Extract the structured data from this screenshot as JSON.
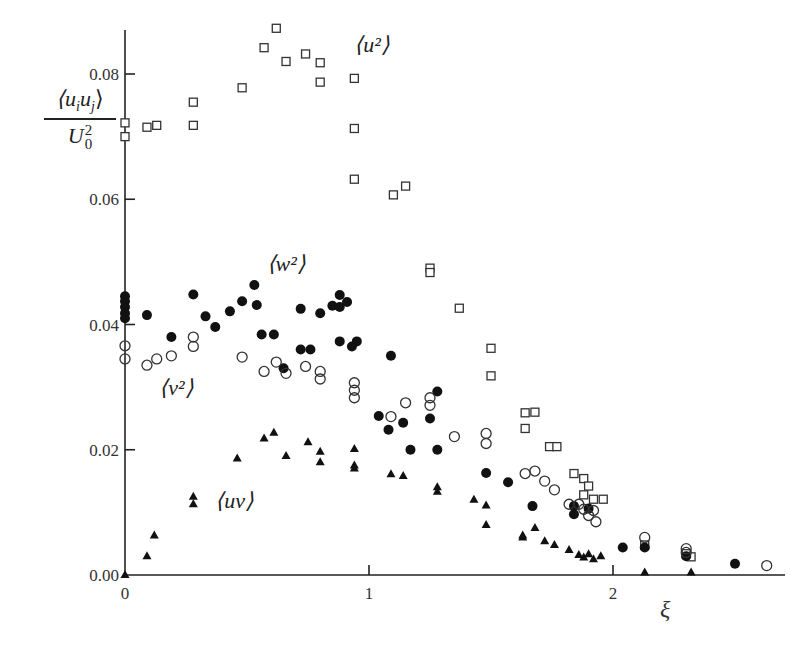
{
  "chart_data": {
    "type": "scatter",
    "title": "",
    "xlabel": "ξ",
    "ylabel_numerator": "⟨u_i u_j⟩",
    "ylabel_denominator": "U_0^2",
    "xlim": [
      0,
      2.7
    ],
    "ylim": [
      0,
      0.088
    ],
    "xticks": [
      0,
      1,
      2
    ],
    "xtick_labels": [
      "0",
      "1",
      "2"
    ],
    "yticks": [
      0.0,
      0.02,
      0.04,
      0.06,
      0.08
    ],
    "ytick_labels": [
      "0.00",
      "0.02",
      "0.04",
      "0.06",
      "0.08"
    ],
    "grid": false,
    "legend": "inline labels",
    "series": [
      {
        "name": "⟨u²⟩",
        "marker": "open-square",
        "label_pos": [
          0.94,
          0.0835
        ],
        "points": [
          [
            0.0,
            0.0722
          ],
          [
            0.0,
            0.07
          ],
          [
            0.09,
            0.0715
          ],
          [
            0.13,
            0.0718
          ],
          [
            0.28,
            0.0755
          ],
          [
            0.28,
            0.0718
          ],
          [
            0.48,
            0.0778
          ],
          [
            0.57,
            0.0842
          ],
          [
            0.62,
            0.0873
          ],
          [
            0.66,
            0.082
          ],
          [
            0.74,
            0.0832
          ],
          [
            0.8,
            0.0818
          ],
          [
            0.8,
            0.0787
          ],
          [
            0.94,
            0.0793
          ],
          [
            0.94,
            0.0713
          ],
          [
            0.94,
            0.0632
          ],
          [
            1.1,
            0.0607
          ],
          [
            1.15,
            0.0621
          ],
          [
            1.25,
            0.049
          ],
          [
            1.25,
            0.0483
          ],
          [
            1.37,
            0.0426
          ],
          [
            1.5,
            0.0362
          ],
          [
            1.5,
            0.0318
          ],
          [
            1.64,
            0.0259
          ],
          [
            1.68,
            0.026
          ],
          [
            1.64,
            0.0234
          ],
          [
            1.74,
            0.0205
          ],
          [
            1.77,
            0.0205
          ],
          [
            1.84,
            0.0162
          ],
          [
            1.88,
            0.0154
          ],
          [
            1.9,
            0.0142
          ],
          [
            1.88,
            0.0128
          ],
          [
            1.92,
            0.0121
          ],
          [
            1.96,
            0.0121
          ],
          [
            2.13,
            0.0048
          ],
          [
            2.3,
            0.0034
          ],
          [
            2.32,
            0.0029
          ]
        ]
      },
      {
        "name": "⟨w²⟩",
        "marker": "filled-circle",
        "label_pos": [
          0.58,
          0.0485
        ],
        "points": [
          [
            0.0,
            0.0445
          ],
          [
            0.0,
            0.0437
          ],
          [
            0.0,
            0.0428
          ],
          [
            0.0,
            0.0418
          ],
          [
            0.0,
            0.041
          ],
          [
            0.09,
            0.0415
          ],
          [
            0.19,
            0.038
          ],
          [
            0.28,
            0.0448
          ],
          [
            0.33,
            0.0413
          ],
          [
            0.37,
            0.0396
          ],
          [
            0.43,
            0.0421
          ],
          [
            0.48,
            0.0437
          ],
          [
            0.53,
            0.0463
          ],
          [
            0.54,
            0.0431
          ],
          [
            0.56,
            0.0384
          ],
          [
            0.61,
            0.0384
          ],
          [
            0.65,
            0.033
          ],
          [
            0.72,
            0.0425
          ],
          [
            0.72,
            0.036
          ],
          [
            0.76,
            0.036
          ],
          [
            0.8,
            0.0418
          ],
          [
            0.85,
            0.043
          ],
          [
            0.88,
            0.0447
          ],
          [
            0.88,
            0.0428
          ],
          [
            0.91,
            0.0436
          ],
          [
            0.88,
            0.0373
          ],
          [
            0.93,
            0.0365
          ],
          [
            0.95,
            0.0373
          ],
          [
            1.09,
            0.035
          ],
          [
            1.04,
            0.0254
          ],
          [
            1.08,
            0.0232
          ],
          [
            1.14,
            0.0243
          ],
          [
            1.25,
            0.025
          ],
          [
            1.28,
            0.0293
          ],
          [
            1.17,
            0.02
          ],
          [
            1.28,
            0.02
          ],
          [
            1.48,
            0.0163
          ],
          [
            1.57,
            0.0148
          ],
          [
            1.67,
            0.011
          ],
          [
            1.84,
            0.011
          ],
          [
            1.84,
            0.0097
          ],
          [
            1.9,
            0.0106
          ],
          [
            2.04,
            0.0044
          ],
          [
            2.13,
            0.0044
          ],
          [
            2.3,
            0.003
          ],
          [
            2.5,
            0.0018
          ]
        ]
      },
      {
        "name": "⟨v²⟩",
        "marker": "open-circle",
        "label_pos": [
          0.14,
          0.0288
        ],
        "points": [
          [
            0.0,
            0.0366
          ],
          [
            0.0,
            0.0345
          ],
          [
            0.09,
            0.0335
          ],
          [
            0.13,
            0.0345
          ],
          [
            0.19,
            0.035
          ],
          [
            0.28,
            0.038
          ],
          [
            0.28,
            0.0365
          ],
          [
            0.48,
            0.0348
          ],
          [
            0.57,
            0.0325
          ],
          [
            0.62,
            0.034
          ],
          [
            0.66,
            0.0322
          ],
          [
            0.74,
            0.0333
          ],
          [
            0.8,
            0.0325
          ],
          [
            0.8,
            0.0313
          ],
          [
            0.94,
            0.0307
          ],
          [
            0.94,
            0.0295
          ],
          [
            0.94,
            0.0283
          ],
          [
            1.09,
            0.0253
          ],
          [
            1.15,
            0.0275
          ],
          [
            1.25,
            0.0283
          ],
          [
            1.25,
            0.0271
          ],
          [
            1.35,
            0.0221
          ],
          [
            1.48,
            0.0226
          ],
          [
            1.48,
            0.021
          ],
          [
            1.64,
            0.0162
          ],
          [
            1.68,
            0.0166
          ],
          [
            1.72,
            0.015
          ],
          [
            1.76,
            0.0136
          ],
          [
            1.82,
            0.0113
          ],
          [
            1.86,
            0.0113
          ],
          [
            1.88,
            0.0105
          ],
          [
            1.92,
            0.0103
          ],
          [
            1.9,
            0.0095
          ],
          [
            1.93,
            0.0085
          ],
          [
            2.13,
            0.006
          ],
          [
            2.3,
            0.0042
          ],
          [
            2.3,
            0.0036
          ],
          [
            2.63,
            0.0015
          ]
        ]
      },
      {
        "name": "⟨uv⟩",
        "marker": "filled-triangle",
        "label_pos": [
          0.37,
          0.0107
        ],
        "points": [
          [
            0.0,
            0.0
          ],
          [
            0.09,
            0.003
          ],
          [
            0.12,
            0.0063
          ],
          [
            0.28,
            0.0125
          ],
          [
            0.28,
            0.0113
          ],
          [
            0.46,
            0.0186
          ],
          [
            0.57,
            0.0218
          ],
          [
            0.61,
            0.0227
          ],
          [
            0.66,
            0.019
          ],
          [
            0.75,
            0.0212
          ],
          [
            0.8,
            0.0197
          ],
          [
            0.8,
            0.018
          ],
          [
            0.94,
            0.0201
          ],
          [
            0.94,
            0.0175
          ],
          [
            0.94,
            0.017
          ],
          [
            1.09,
            0.0161
          ],
          [
            1.14,
            0.0158
          ],
          [
            1.28,
            0.014
          ],
          [
            1.28,
            0.0133
          ],
          [
            1.43,
            0.012
          ],
          [
            1.48,
            0.0111
          ],
          [
            1.48,
            0.008
          ],
          [
            1.63,
            0.0063
          ],
          [
            1.63,
            0.006
          ],
          [
            1.68,
            0.0075
          ],
          [
            1.72,
            0.0054
          ],
          [
            1.76,
            0.0048
          ],
          [
            1.82,
            0.004
          ],
          [
            1.86,
            0.0032
          ],
          [
            1.88,
            0.0028
          ],
          [
            1.9,
            0.0033
          ],
          [
            1.92,
            0.0025
          ],
          [
            1.95,
            0.003
          ],
          [
            2.13,
            0.0004
          ],
          [
            2.32,
            0.0004
          ]
        ]
      }
    ]
  },
  "labels": {
    "y_num_main": "⟨u",
    "y_num_i": "i",
    "y_num_mid": "u",
    "y_num_j": "j",
    "y_num_close": "⟩",
    "y_den_main": "U",
    "y_den_sub": "0",
    "y_den_sup": "2",
    "x_label": "ξ"
  }
}
